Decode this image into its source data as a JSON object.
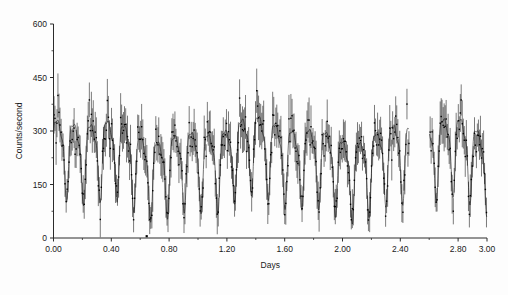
{
  "chart_data": {
    "type": "scatter",
    "title": "",
    "subtitle": "",
    "xlabel": "Days",
    "ylabel": "Counts/second",
    "xlim": [
      0.0,
      3.0
    ],
    "ylim": [
      0,
      600
    ],
    "grid": false,
    "legend": null,
    "x_ticks": [
      0.0,
      0.4,
      0.8,
      1.2,
      1.6,
      2.0,
      2.4,
      2.8,
      3.0
    ],
    "x_tick_labels": [
      "0.00",
      "0.40",
      "0.80",
      "1.20",
      "1.60",
      "2.00",
      "2.40",
      "2.80",
      "3.00"
    ],
    "x_minor_tick_step": 0.2,
    "y_ticks": [
      0,
      150,
      300,
      450,
      600
    ],
    "y_tick_labels": [
      "0",
      "150",
      "300",
      "450",
      "600"
    ],
    "y_minor_tick_step": 75,
    "series": [
      {
        "name": "count rate",
        "style": "points-with-error-bars",
        "marker": "dot",
        "color": "#0d0d0d",
        "description": "Dense high-cadence photon count rate measurements with vertical 1-sigma error bars, showing strong quasi-periodic modulation of roughly 8 to 9 cycles per day between about 80 and 500 counts per second."
      },
      {
        "name": "smoothed envelope",
        "style": "line",
        "color": "#3a3a3a",
        "description": "Smooth running-mean curve tracing the mean count rate through the scattered measurements."
      }
    ],
    "modulation": {
      "cycles_per_day": 8.6,
      "period_days": 0.1163,
      "mean_level": 230,
      "amplitude": 95,
      "peak_max": 505,
      "min_value": 70,
      "outlier_points": [
        {
          "x": 0.645,
          "y": 5
        }
      ]
    },
    "data_gaps": [
      [
        2.46,
        2.6
      ]
    ],
    "n_points": 430
  },
  "figure": {
    "background": "#fdfdfd",
    "axis_color": "#2b2b2b",
    "data_color": "#0d0d0d",
    "curve_color": "#3a3a3a"
  }
}
